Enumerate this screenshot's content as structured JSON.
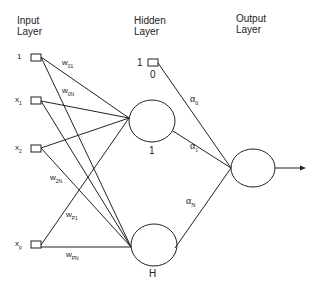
{
  "layers": {
    "input": {
      "title_line1": "Input",
      "title_line2": "Layer"
    },
    "hidden": {
      "title_line1": "Hidden",
      "title_line2": "Layer"
    },
    "output": {
      "title_line1": "Output",
      "title_line2": "Layer"
    }
  },
  "inputs": [
    {
      "label": "1",
      "sub": ""
    },
    {
      "label": "x",
      "sub": "1"
    },
    {
      "label": "x",
      "sub": "2"
    },
    {
      "label": "x",
      "sub": "p"
    }
  ],
  "input_weights": [
    {
      "label": "w",
      "sub": "01"
    },
    {
      "label": "w",
      "sub": "0N"
    },
    {
      "label": "w",
      "sub": "2N"
    },
    {
      "label": "w",
      "sub": "P1"
    },
    {
      "label": "w",
      "sub": "PN"
    }
  ],
  "hidden_bias": {
    "label": "1",
    "index": "0"
  },
  "hidden_nodes": [
    {
      "label": "1"
    },
    {
      "label": "H"
    }
  ],
  "output_weights": [
    {
      "label": "α",
      "sub": "0"
    },
    {
      "label": "α",
      "sub": "1"
    },
    {
      "label": "α",
      "sub": "N"
    }
  ],
  "colors": {
    "stroke": "#222222",
    "background": "#ffffff"
  }
}
